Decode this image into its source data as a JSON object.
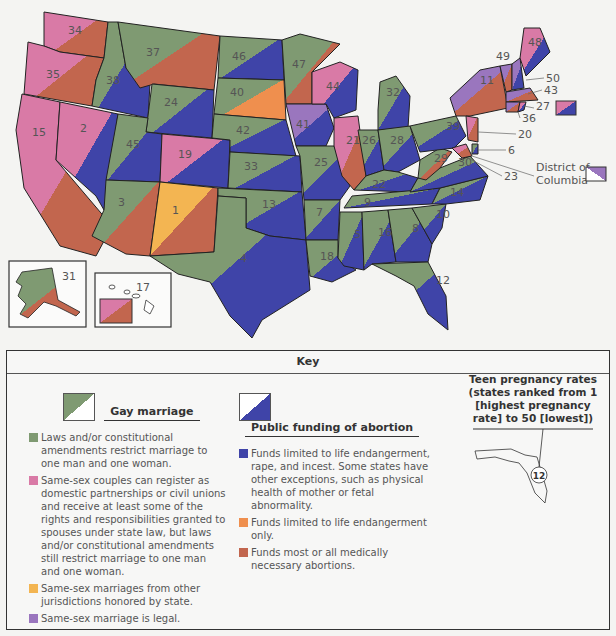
{
  "colors": {
    "green": "#7f9a72",
    "pink": "#d97aa6",
    "yellow": "#f3b552",
    "purple": "#9a76be",
    "blue": "#3f44a8",
    "orange": "#ef8f4e",
    "brown": "#c2664e",
    "white": "#ffffff"
  },
  "map": {
    "title": "Teen pregnancy, gay marriage, and public funding of abortion by state",
    "states": [
      {
        "rank": "34",
        "marriage": "pink",
        "funding": "brown"
      },
      {
        "rank": "35",
        "marriage": "pink",
        "funding": "brown"
      },
      {
        "rank": "15",
        "marriage": "pink",
        "funding": "brown"
      },
      {
        "rank": "2",
        "marriage": "pink",
        "funding": "blue"
      },
      {
        "rank": "38",
        "marriage": "green",
        "funding": "blue"
      },
      {
        "rank": "37",
        "marriage": "green",
        "funding": "brown"
      },
      {
        "rank": "24",
        "marriage": "green",
        "funding": "blue"
      },
      {
        "rank": "45",
        "marriage": "green",
        "funding": "blue"
      },
      {
        "rank": "19",
        "marriage": "pink",
        "funding": "blue"
      },
      {
        "rank": "3",
        "marriage": "green",
        "funding": "brown"
      },
      {
        "rank": "1",
        "marriage": "yellow",
        "funding": "brown"
      },
      {
        "rank": "46",
        "marriage": "green",
        "funding": "blue"
      },
      {
        "rank": "40",
        "marriage": "green",
        "funding": "orange"
      },
      {
        "rank": "42",
        "marriage": "green",
        "funding": "blue"
      },
      {
        "rank": "33",
        "marriage": "green",
        "funding": "blue"
      },
      {
        "rank": "13",
        "marriage": "green",
        "funding": "blue"
      },
      {
        "rank": "4",
        "marriage": "green",
        "funding": "blue"
      },
      {
        "rank": "47",
        "marriage": "green",
        "funding": "brown"
      },
      {
        "rank": "41",
        "marriage": "purple",
        "funding": "blue"
      },
      {
        "rank": "25",
        "marriage": "green",
        "funding": "blue"
      },
      {
        "rank": "7",
        "marriage": "green",
        "funding": "blue"
      },
      {
        "rank": "18",
        "marriage": "green",
        "funding": "blue"
      },
      {
        "rank": "44",
        "marriage": "pink",
        "funding": "blue"
      },
      {
        "rank": "21",
        "marriage": "pink",
        "funding": "brown"
      },
      {
        "rank": "32",
        "marriage": "green",
        "funding": "blue"
      },
      {
        "rank": "26",
        "marriage": "green",
        "funding": "blue"
      },
      {
        "rank": "28",
        "marriage": "green",
        "funding": "blue"
      },
      {
        "rank": "22",
        "marriage": "green",
        "funding": "blue"
      },
      {
        "rank": "9",
        "marriage": "green",
        "funding": "blue"
      },
      {
        "rank": "5",
        "marriage": "green",
        "funding": "blue"
      },
      {
        "rank": "16",
        "marriage": "green",
        "funding": "blue"
      },
      {
        "rank": "8",
        "marriage": "green",
        "funding": "blue"
      },
      {
        "rank": "12",
        "marriage": "green",
        "funding": "blue"
      },
      {
        "rank": "10",
        "marriage": "green",
        "funding": "blue"
      },
      {
        "rank": "14",
        "marriage": "green",
        "funding": "blue"
      },
      {
        "rank": "30",
        "marriage": "green",
        "funding": "blue"
      },
      {
        "rank": "29",
        "marriage": "green",
        "funding": "brown"
      },
      {
        "rank": "39",
        "marriage": "green",
        "funding": "blue"
      },
      {
        "rank": "11",
        "marriage": "purple",
        "funding": "brown"
      },
      {
        "rank": "49",
        "marriage": "purple",
        "funding": "brown"
      },
      {
        "rank": "48",
        "marriage": "pink",
        "funding": "blue"
      },
      {
        "rank": "50",
        "marriage": "purple",
        "funding": "blue"
      },
      {
        "rank": "43",
        "marriage": "purple",
        "funding": "brown"
      },
      {
        "rank": "27",
        "marriage": "pink",
        "funding": "blue"
      },
      {
        "rank": "36",
        "marriage": "purple",
        "funding": "brown"
      },
      {
        "rank": "20",
        "marriage": "pink",
        "funding": "brown"
      },
      {
        "rank": "6",
        "marriage": "green",
        "funding": "blue"
      },
      {
        "rank": "23",
        "marriage": "pink",
        "funding": "brown"
      },
      {
        "rank": "31",
        "marriage": "green",
        "funding": "brown"
      },
      {
        "rank": "17",
        "marriage": "pink",
        "funding": "brown"
      }
    ],
    "callouts": {
      "dc_label_line1": "District of",
      "dc_label_line2": "Columbia",
      "dc_marriage": "purple",
      "dc_funding": "white",
      "ri_rank": "27"
    }
  },
  "key": {
    "title": "Key",
    "gay_marriage": {
      "heading": "Gay marriage",
      "items": [
        {
          "color": "#7f9a72",
          "text": "Laws and/or constitutional amendments restrict marriage to one man and one woman."
        },
        {
          "color": "#d97aa6",
          "text": "Same-sex couples can register as domestic partnerships or civil unions and receive at least some of the rights and responsibilities granted to spouses under state law, but laws and/or constitutional amendments still restrict marriage to one man and one woman."
        },
        {
          "color": "#f3b552",
          "text": "Same-sex marriages from other jurisdictions honored by state."
        },
        {
          "color": "#9a76be",
          "text": "Same-sex marriage is legal."
        }
      ]
    },
    "abortion_funding": {
      "heading": "Public funding of abortion",
      "items": [
        {
          "color": "#3f44a8",
          "text": "Funds limited to life endangerment, rape, and incest. Some states have other exceptions, such as physical health of mother or fetal abnormality."
        },
        {
          "color": "#ef8f4e",
          "text": "Funds limited to life endangerment only."
        },
        {
          "color": "#c2664e",
          "text": "Funds most or all medically necessary abortions."
        }
      ]
    },
    "teen_pregnancy": {
      "heading_line1": "Teen pregnancy rates",
      "heading_line2": "(states ranked from 1",
      "heading_line3": "[highest pregnancy",
      "heading_line4": "rate] to 50 [lowest])",
      "example_rank": "12"
    }
  }
}
